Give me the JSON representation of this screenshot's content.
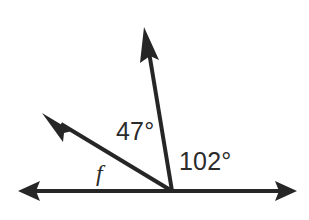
{
  "figure": {
    "kind": "angle-diagram",
    "background_color": "#ffffff",
    "stroke_color": "#262626",
    "text_color": "#2b2b2b",
    "width": 309,
    "height": 220
  },
  "vertex": {
    "name": "vertex",
    "x": 172,
    "y": 191
  },
  "rays": [
    {
      "name": "ray-right",
      "label": "",
      "from_x": 172,
      "from_y": 191,
      "to_x": 297,
      "to_y": 191,
      "direction_deg": 0,
      "arrowhead": true,
      "thickness": 4
    },
    {
      "name": "ray-left",
      "label": "",
      "from_x": 172,
      "from_y": 191,
      "to_x": 18,
      "to_y": 191,
      "direction_deg": 180,
      "arrowhead": true,
      "thickness": 4
    },
    {
      "name": "ray-up",
      "label": "",
      "from_x": 172,
      "from_y": 191,
      "to_x": 144,
      "to_y": 27,
      "direction_deg": 102,
      "arrowhead": true,
      "thickness": 4
    },
    {
      "name": "ray-f",
      "label": "f",
      "from_x": 172,
      "from_y": 191,
      "to_x": 42,
      "to_y": 113,
      "direction_deg": 149,
      "arrowhead": true,
      "thickness": 4
    }
  ],
  "labels": {
    "angle_47": "47°",
    "angle_102": "102°",
    "ray_f": "f"
  },
  "angles": [
    {
      "name": "angle-47",
      "text": "47°",
      "value": 47,
      "unit": "degrees",
      "between": [
        "ray-f",
        "ray-up"
      ]
    },
    {
      "name": "angle-102",
      "text": "102°",
      "value": 102,
      "unit": "degrees",
      "between": [
        "ray-up",
        "ray-right"
      ]
    },
    {
      "name": "angle-f",
      "text": "f",
      "value": null,
      "unit": "degrees",
      "between": [
        "ray-left",
        "ray-f"
      ]
    }
  ]
}
